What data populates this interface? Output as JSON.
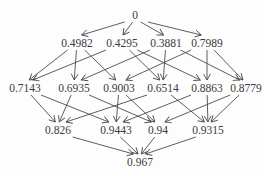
{
  "diagram": {
    "type": "directed-graph-lattice",
    "background_color": "#fdfdfd",
    "text_color": "#3a3a3a",
    "arrow_color": "#4c4c4c",
    "nodes": [
      {
        "id": "root",
        "label": "0",
        "x": 135,
        "y": 15
      },
      {
        "id": "a",
        "label": "0.4982",
        "x": 77,
        "y": 43
      },
      {
        "id": "b",
        "label": "0.4295",
        "x": 122,
        "y": 43
      },
      {
        "id": "c",
        "label": "0.3881",
        "x": 166,
        "y": 43
      },
      {
        "id": "d",
        "label": "0.7989",
        "x": 207,
        "y": 43
      },
      {
        "id": "ab",
        "label": "0.7143",
        "x": 25,
        "y": 88
      },
      {
        "id": "ac",
        "label": "0.6935",
        "x": 74,
        "y": 88
      },
      {
        "id": "ad",
        "label": "0.9003",
        "x": 119,
        "y": 88
      },
      {
        "id": "bc",
        "label": "0.6514",
        "x": 163,
        "y": 88
      },
      {
        "id": "bd",
        "label": "0.8863",
        "x": 207,
        "y": 88
      },
      {
        "id": "cd",
        "label": "0.8779",
        "x": 246,
        "y": 88
      },
      {
        "id": "abc",
        "label": "0.826",
        "x": 58,
        "y": 130
      },
      {
        "id": "abd",
        "label": "0.9443",
        "x": 116,
        "y": 130
      },
      {
        "id": "acd",
        "label": "0.94",
        "x": 158,
        "y": 130
      },
      {
        "id": "bcd",
        "label": "0.9315",
        "x": 208,
        "y": 130
      },
      {
        "id": "abcd",
        "label": "0.967",
        "x": 140,
        "y": 162
      }
    ],
    "edges": [
      [
        "root",
        "a"
      ],
      [
        "root",
        "b"
      ],
      [
        "root",
        "c"
      ],
      [
        "root",
        "d"
      ],
      [
        "a",
        "ab"
      ],
      [
        "a",
        "ac"
      ],
      [
        "a",
        "ad"
      ],
      [
        "b",
        "ab"
      ],
      [
        "b",
        "bc"
      ],
      [
        "b",
        "bd"
      ],
      [
        "c",
        "ac"
      ],
      [
        "c",
        "bc"
      ],
      [
        "c",
        "cd"
      ],
      [
        "d",
        "ad"
      ],
      [
        "d",
        "bd"
      ],
      [
        "d",
        "cd"
      ],
      [
        "ab",
        "abc"
      ],
      [
        "ab",
        "abd"
      ],
      [
        "ac",
        "abc"
      ],
      [
        "ac",
        "acd"
      ],
      [
        "ad",
        "abd"
      ],
      [
        "ad",
        "acd"
      ],
      [
        "bc",
        "abc"
      ],
      [
        "bc",
        "bcd"
      ],
      [
        "bd",
        "abd"
      ],
      [
        "bd",
        "bcd"
      ],
      [
        "cd",
        "acd"
      ],
      [
        "cd",
        "bcd"
      ],
      [
        "abc",
        "abcd"
      ],
      [
        "abd",
        "abcd"
      ],
      [
        "acd",
        "abcd"
      ],
      [
        "bcd",
        "abcd"
      ]
    ]
  }
}
